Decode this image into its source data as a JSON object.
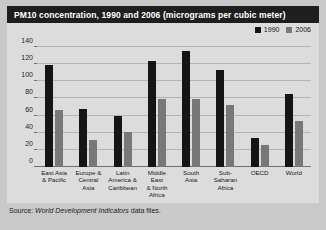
{
  "title": "PM10 concentration, 1990 and 2006 (micrograms per cubic meter)",
  "source": {
    "prefix": "Source: ",
    "italic": "World Development Indicators",
    "suffix": " data files."
  },
  "legend": [
    {
      "label": "1990",
      "color": "#151515"
    },
    {
      "label": "2006",
      "color": "#787878"
    }
  ],
  "chart_data": {
    "type": "bar",
    "title": "PM10 concentration, 1990 and 2006 (micrograms per cubic meter)",
    "xlabel": "",
    "ylabel": "",
    "ylim": [
      0,
      140
    ],
    "yticks": [
      0,
      20,
      40,
      60,
      80,
      100,
      120,
      140
    ],
    "grid": true,
    "legend_position": "top-right",
    "categories": [
      "East Asia & Pacific",
      "Europe & Central Asia",
      "Latin America & Caribbean",
      "Middle East & North Africa",
      "South Asia",
      "Sub-Saharan Africa",
      "OECD",
      "World"
    ],
    "category_lines": [
      [
        "East Asia",
        "& Pacific"
      ],
      [
        "Europe &",
        "Central",
        "Asia"
      ],
      [
        "Latin",
        "America &",
        "Caribbean"
      ],
      [
        "Middle East",
        "& North",
        "Africa"
      ],
      [
        "South",
        "Asia"
      ],
      [
        "Sub-Saharan",
        "Africa"
      ],
      [
        "OECD"
      ],
      [
        "World"
      ]
    ],
    "series": [
      {
        "name": "1990",
        "color": "#151515",
        "values": [
          119,
          68,
          60,
          124,
          135,
          113,
          34,
          85
        ]
      },
      {
        "name": "2006",
        "color": "#787878",
        "values": [
          67,
          32,
          41,
          79,
          79,
          72,
          26,
          54
        ]
      }
    ]
  }
}
